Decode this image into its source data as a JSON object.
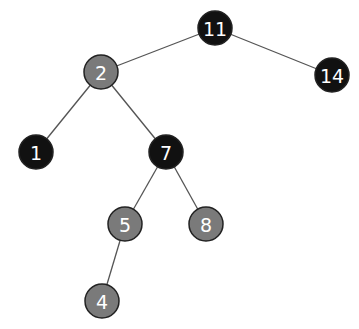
{
  "diagram": {
    "type": "red-black-tree",
    "colors": {
      "black": "#111111",
      "red_shown_as_gray": "#7a7a7a",
      "edge": "#555555",
      "label": "#ffffff"
    },
    "nodes": [
      {
        "id": "n11",
        "label": "11",
        "color": "black",
        "x": 215,
        "y": 28
      },
      {
        "id": "n2",
        "label": "2",
        "color": "gray",
        "x": 101,
        "y": 72
      },
      {
        "id": "n14",
        "label": "14",
        "color": "black",
        "x": 332,
        "y": 75
      },
      {
        "id": "n1",
        "label": "1",
        "color": "black",
        "x": 36,
        "y": 152
      },
      {
        "id": "n7",
        "label": "7",
        "color": "black",
        "x": 166,
        "y": 152
      },
      {
        "id": "n5",
        "label": "5",
        "color": "gray",
        "x": 125,
        "y": 224
      },
      {
        "id": "n8",
        "label": "8",
        "color": "gray",
        "x": 206,
        "y": 224
      },
      {
        "id": "n4",
        "label": "4",
        "color": "gray",
        "x": 102,
        "y": 301
      }
    ],
    "edges": [
      {
        "from": "n11",
        "to": "n2"
      },
      {
        "from": "n11",
        "to": "n14"
      },
      {
        "from": "n2",
        "to": "n1"
      },
      {
        "from": "n2",
        "to": "n7"
      },
      {
        "from": "n7",
        "to": "n5"
      },
      {
        "from": "n7",
        "to": "n8"
      },
      {
        "from": "n5",
        "to": "n4"
      }
    ]
  }
}
